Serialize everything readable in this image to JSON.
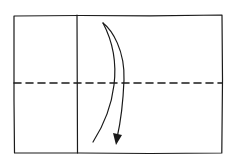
{
  "diagram": {
    "type": "origami-fold-step",
    "stroke_color": "#1a1a1a",
    "background": "#ffffff",
    "paper": {
      "x": 14,
      "y": 15,
      "width": 208,
      "height": 138
    },
    "crease_line": {
      "orientation": "vertical",
      "x": 77
    },
    "fold_line": {
      "style": "dashed",
      "orientation": "horizontal",
      "y": 83
    },
    "arrow": {
      "direction": "down",
      "meaning": "fold top half down"
    }
  }
}
